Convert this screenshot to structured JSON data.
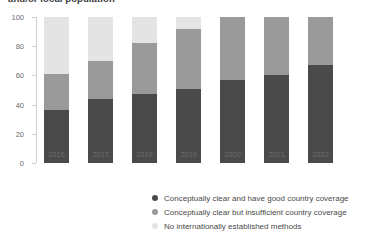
{
  "chart_data": {
    "type": "bar",
    "title": "and/or local population",
    "subtitle": "",
    "xlabel": "",
    "ylabel": "",
    "stacked": true,
    "percentage": true,
    "ylim": [
      0,
      100
    ],
    "yticks": [
      0,
      20,
      40,
      60,
      80,
      100
    ],
    "ytick_labels": [
      "0",
      "20",
      "40",
      "60",
      "80",
      "100"
    ],
    "grid": false,
    "legend_position": "bottom",
    "categories": [
      "2016",
      "2017",
      "2018",
      "2019",
      "2020",
      "2021",
      "2022"
    ],
    "series": [
      {
        "name": "Conceptually clear and have good country coverage",
        "color": "#4a4a4a",
        "values": [
          36,
          44,
          47,
          51,
          57,
          60,
          67
        ]
      },
      {
        "name": "Conceptually clear but insufficient country coverage",
        "color": "#9a9a9a",
        "values": [
          25,
          26,
          35,
          41,
          43,
          40,
          33
        ]
      },
      {
        "name": "No internationally established methods",
        "color": "#e4e4e4",
        "values": [
          39,
          30,
          18,
          8,
          0,
          0,
          0
        ]
      }
    ]
  },
  "axis": {
    "y_tick_labels": [
      "100",
      "80",
      "60",
      "40",
      "20",
      "0"
    ]
  },
  "legend": {
    "items": [
      {
        "label": "Conceptually clear and have good country coverage",
        "color": "#4a4a4a"
      },
      {
        "label": "Conceptually clear but insufficient country coverage",
        "color": "#9a9a9a"
      },
      {
        "label": "No internationally established methods",
        "color": "#e4e4e4"
      }
    ]
  }
}
